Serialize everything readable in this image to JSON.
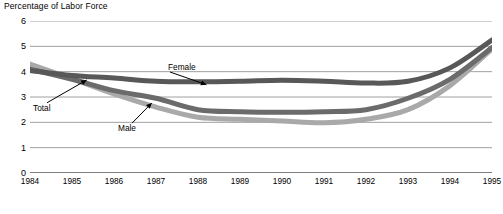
{
  "chart_data": {
    "type": "line",
    "title": "Percentage of Labor Force",
    "xlabel": "",
    "ylabel": "Percentage of Labor Force",
    "ylim": [
      0,
      6
    ],
    "yticks": [
      0,
      1,
      2,
      3,
      4,
      5,
      6
    ],
    "xlim": [
      1984,
      1995
    ],
    "grid": true,
    "legend_position": "inline-annotations",
    "categories": [
      1984,
      1985,
      1986,
      1987,
      1988,
      1989,
      1990,
      1991,
      1992,
      1993,
      1994,
      1995
    ],
    "x": [
      "1984",
      "1985",
      "1986",
      "1987",
      "1988",
      "1989",
      "1990",
      "1991",
      "1992",
      "1993",
      "1994",
      "1995"
    ],
    "series": [
      {
        "name": "Female",
        "color": "#585858",
        "values": [
          4.05,
          3.85,
          3.75,
          3.62,
          3.6,
          3.62,
          3.66,
          3.62,
          3.55,
          3.62,
          4.15,
          5.25
        ]
      },
      {
        "name": "Total",
        "color": "#6b6b6b",
        "values": [
          4.1,
          3.7,
          3.25,
          2.95,
          2.5,
          2.42,
          2.4,
          2.42,
          2.5,
          2.95,
          3.7,
          4.95
        ]
      },
      {
        "name": "Male",
        "color": "#a9a9a9",
        "values": [
          4.3,
          3.72,
          3.12,
          2.6,
          2.2,
          2.12,
          2.05,
          1.98,
          2.12,
          2.5,
          3.45,
          4.9
        ]
      }
    ],
    "annotations": [
      {
        "label": "Female",
        "series": "Female",
        "points_to_year": 1988.2
      },
      {
        "label": "Total",
        "series": "Total",
        "points_to_year": 1985.35
      },
      {
        "label": "Male",
        "series": "Male",
        "points_to_year": 1986.9
      }
    ]
  }
}
